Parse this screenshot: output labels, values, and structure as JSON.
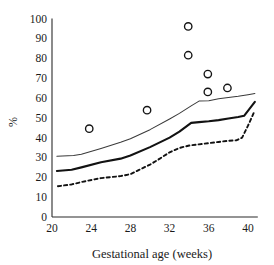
{
  "chart_data": {
    "type": "line",
    "title": "",
    "xlabel": "Gestational age (weeks)",
    "ylabel": "%",
    "xlim": [
      20,
      41
    ],
    "ylim": [
      0,
      100
    ],
    "grid": false,
    "legend": "none",
    "xticks": [
      20,
      24,
      28,
      32,
      36,
      40
    ],
    "yticks": [
      0,
      10,
      20,
      30,
      40,
      50,
      60,
      70,
      80,
      90,
      100
    ],
    "xtick_labels": [
      "20",
      "24",
      "28",
      "32",
      "36",
      "40"
    ],
    "ytick_labels": [
      "0",
      "10",
      "20",
      "30",
      "40",
      "50",
      "60",
      "70",
      "80",
      "90",
      "100"
    ],
    "series": [
      {
        "name": "upper-reference-line",
        "style": "thin-solid",
        "color": "#3a3a3a",
        "x": [
          20.5,
          22.2,
          23.0,
          25.0,
          27.0,
          28.0,
          30.0,
          32.0,
          33.0,
          34.2,
          35.0,
          36.0,
          37.0,
          38.0,
          39.0,
          40.0,
          40.7
        ],
        "y": [
          30.6,
          31.0,
          31.6,
          34.5,
          37.6,
          39.4,
          44.0,
          49.4,
          52.2,
          56.0,
          58.4,
          58.6,
          59.6,
          60.2,
          60.8,
          61.6,
          62.2
        ]
      },
      {
        "name": "median-line",
        "style": "thick-solid",
        "color": "#121212",
        "x": [
          20.5,
          22.0,
          23.0,
          25.0,
          27.0,
          28.0,
          30.0,
          32.0,
          33.0,
          34.2,
          35.0,
          36.0,
          37.0,
          38.0,
          39.0,
          39.6,
          40.7
        ],
        "y": [
          23.2,
          23.8,
          25.0,
          27.6,
          29.4,
          31.0,
          35.2,
          40.0,
          43.0,
          47.4,
          47.8,
          48.2,
          48.8,
          49.6,
          50.4,
          51.0,
          58.0
        ]
      },
      {
        "name": "lower-reference-line",
        "style": "dashed",
        "color": "#121212",
        "x": [
          20.6,
          22.0,
          23.0,
          25.0,
          27.0,
          28.0,
          29.0,
          30.0,
          31.0,
          32.0,
          33.0,
          34.0,
          35.0,
          36.0,
          37.0,
          38.0,
          38.8,
          39.4,
          40.0,
          40.6
        ],
        "y": [
          15.5,
          16.4,
          17.6,
          19.6,
          20.6,
          21.6,
          24.0,
          26.4,
          29.4,
          32.6,
          34.8,
          36.0,
          36.6,
          37.2,
          37.8,
          38.4,
          38.6,
          40.0,
          46.0,
          52.6
        ]
      }
    ],
    "scatter": {
      "name": "observed-data-points",
      "marker": "open-circle",
      "color": "#141414",
      "points": [
        {
          "x": 23.8,
          "y": 44.5
        },
        {
          "x": 29.7,
          "y": 53.8
        },
        {
          "x": 33.9,
          "y": 96.0
        },
        {
          "x": 33.9,
          "y": 81.5
        },
        {
          "x": 35.9,
          "y": 72.0
        },
        {
          "x": 35.9,
          "y": 63.0
        },
        {
          "x": 37.9,
          "y": 65.0
        }
      ]
    }
  }
}
